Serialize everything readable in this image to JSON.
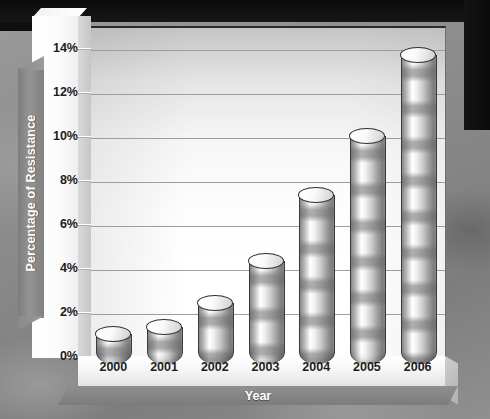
{
  "chart_data": {
    "type": "bar",
    "title": "",
    "subtitle": "",
    "xlabel": "Year",
    "ylabel": "Percentage of Resistance",
    "categories": [
      "2000",
      "2001",
      "2002",
      "2003",
      "2004",
      "2005",
      "2006"
    ],
    "values": [
      1.0,
      1.3,
      2.4,
      4.3,
      7.3,
      10.0,
      13.7
    ],
    "series": [
      {
        "name": "Percentage of Resistance",
        "values": [
          1.0,
          1.3,
          2.4,
          4.3,
          7.3,
          10.0,
          13.7
        ]
      }
    ],
    "ylim": [
      0,
      15
    ],
    "ytick_labels": [
      "0%",
      "2%",
      "4%",
      "6%",
      "8%",
      "10%",
      "12%",
      "14%"
    ],
    "ytick_values": [
      0,
      2,
      4,
      6,
      8,
      10,
      12,
      14
    ],
    "grid": true,
    "grid_axis": "y",
    "legend": false,
    "legend_position": "none",
    "style": "3d-cylinder",
    "colors": {
      "bar_light": "#ffffff",
      "bar_mid": "#c9c9c9",
      "bar_dark": "#7f7f7f",
      "bar_outline": "#3a3a3a",
      "gridline": "#9d9d9d",
      "panel_background": "#ffffff",
      "axis_banner": "#8a8a8a",
      "axis_banner_text": "#ffffff",
      "tick_text": "#1d1d1d",
      "outer_background": "#8e8e8e",
      "top_band": "#0b0b0b"
    }
  }
}
